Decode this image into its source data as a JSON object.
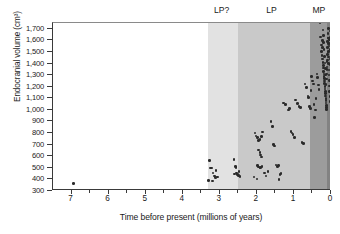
{
  "chart_data": {
    "type": "scatter",
    "title": "",
    "xlabel": "Time before present (millions of years)",
    "ylabel": "Endocranial volume (cm³)",
    "xlim": [
      7.5,
      0
    ],
    "ylim": [
      300,
      1750
    ],
    "x_reversed": true,
    "grid": false,
    "legend_position": "none",
    "xticks": [
      7,
      6,
      5,
      4,
      3,
      2,
      1,
      0
    ],
    "xtick_labels": [
      "7",
      "6",
      "5",
      "4",
      "3",
      "2",
      "1",
      "0"
    ],
    "xminor_ticks": [
      6.5,
      5.5,
      4.5,
      3.5,
      2.5,
      1.5,
      0.5
    ],
    "yticks": [
      300,
      400,
      500,
      600,
      700,
      800,
      900,
      1000,
      1100,
      1200,
      1300,
      1400,
      1500,
      1600,
      1700
    ],
    "ytick_labels": [
      "300",
      "400",
      "500",
      "600",
      "700",
      "800",
      "900",
      "1,000",
      "1,100",
      "1,200",
      "1,300",
      "1,400",
      "1,500",
      "1,600",
      "1,700"
    ],
    "bands": [
      {
        "label": "LP?",
        "x_start": 3.32,
        "x_end": 2.52,
        "color": "#e2e2e2",
        "label_x": 2.92
      },
      {
        "label": "LP",
        "x_start": 2.52,
        "x_end": 0.56,
        "color": "#c9c9c9",
        "label_x": 1.58
      },
      {
        "label": "MP",
        "x_start": 0.56,
        "x_end": 0.12,
        "color": "#9c9c9c",
        "label_x": 0.3
      },
      {
        "label": "",
        "x_start": 0.12,
        "x_end": 0.0,
        "color": "#828282",
        "label_x": 0.05
      }
    ],
    "point_color": "#2a2a2a",
    "points": [
      [
        6.95,
        365
      ],
      [
        4.4,
        308
      ],
      [
        3.28,
        565
      ],
      [
        3.25,
        500
      ],
      [
        3.22,
        498
      ],
      [
        3.18,
        455
      ],
      [
        3.15,
        430
      ],
      [
        3.12,
        415
      ],
      [
        3.1,
        478
      ],
      [
        3.06,
        420
      ],
      [
        3.3,
        392
      ],
      [
        3.2,
        388
      ],
      [
        2.62,
        570
      ],
      [
        2.58,
        512
      ],
      [
        2.55,
        455
      ],
      [
        2.52,
        440
      ],
      [
        2.5,
        432
      ],
      [
        2.48,
        470
      ],
      [
        2.45,
        425
      ],
      [
        2.56,
        505
      ],
      [
        2.6,
        448
      ],
      [
        2.05,
        800
      ],
      [
        2.02,
        775
      ],
      [
        1.98,
        760
      ],
      [
        1.95,
        735
      ],
      [
        1.92,
        742
      ],
      [
        1.88,
        770
      ],
      [
        1.85,
        810
      ],
      [
        1.95,
        655
      ],
      [
        1.92,
        630
      ],
      [
        1.9,
        610
      ],
      [
        1.88,
        592
      ],
      [
        1.98,
        520
      ],
      [
        1.95,
        508
      ],
      [
        1.92,
        497
      ],
      [
        1.9,
        502
      ],
      [
        1.86,
        512
      ],
      [
        2.08,
        420
      ],
      [
        2.0,
        405
      ],
      [
        1.8,
        455
      ],
      [
        1.75,
        430
      ],
      [
        1.7,
        470
      ],
      [
        1.62,
        900
      ],
      [
        1.58,
        855
      ],
      [
        1.55,
        700
      ],
      [
        1.52,
        690
      ],
      [
        1.48,
        525
      ],
      [
        1.45,
        512
      ],
      [
        1.42,
        520
      ],
      [
        1.4,
        398
      ],
      [
        1.38,
        440
      ],
      [
        1.35,
        450
      ],
      [
        1.28,
        1060
      ],
      [
        1.22,
        1045
      ],
      [
        1.15,
        1000
      ],
      [
        1.12,
        1010
      ],
      [
        1.08,
        815
      ],
      [
        1.05,
        800
      ],
      [
        1.02,
        790
      ],
      [
        0.98,
        760
      ],
      [
        0.95,
        1085
      ],
      [
        0.9,
        1055
      ],
      [
        0.86,
        1030
      ],
      [
        0.82,
        1020
      ],
      [
        0.78,
        720
      ],
      [
        0.74,
        712
      ],
      [
        0.7,
        1225
      ],
      [
        0.66,
        1195
      ],
      [
        0.62,
        1120
      ],
      [
        0.6,
        1105
      ],
      [
        0.58,
        1030
      ],
      [
        0.56,
        1010
      ],
      [
        0.54,
        1165
      ],
      [
        0.52,
        1290
      ],
      [
        0.5,
        1250
      ],
      [
        0.48,
        1225
      ],
      [
        0.46,
        1045
      ],
      [
        0.44,
        935
      ],
      [
        0.42,
        1000
      ],
      [
        0.4,
        1100
      ],
      [
        0.38,
        1310
      ],
      [
        0.36,
        1280
      ],
      [
        0.34,
        1215
      ],
      [
        0.32,
        1175
      ],
      [
        0.3,
        1750
      ],
      [
        0.28,
        1630
      ],
      [
        0.26,
        1560
      ],
      [
        0.25,
        1505
      ],
      [
        0.24,
        1470
      ],
      [
        0.23,
        1440
      ],
      [
        0.22,
        1410
      ],
      [
        0.21,
        1385
      ],
      [
        0.2,
        1360
      ],
      [
        0.195,
        1330
      ],
      [
        0.19,
        1310
      ],
      [
        0.185,
        1290
      ],
      [
        0.18,
        1270
      ],
      [
        0.175,
        1250
      ],
      [
        0.17,
        1230
      ],
      [
        0.165,
        1200
      ],
      [
        0.16,
        1180
      ],
      [
        0.155,
        1160
      ],
      [
        0.15,
        1140
      ],
      [
        0.145,
        1120
      ],
      [
        0.14,
        1100
      ],
      [
        0.135,
        1080
      ],
      [
        0.13,
        1060
      ],
      [
        0.125,
        1040
      ],
      [
        0.12,
        1020
      ],
      [
        0.115,
        1005
      ],
      [
        0.11,
        1350
      ],
      [
        0.105,
        1420
      ],
      [
        0.1,
        1480
      ],
      [
        0.095,
        1540
      ],
      [
        0.09,
        1590
      ],
      [
        0.085,
        1620
      ],
      [
        0.08,
        1660
      ],
      [
        0.075,
        1700
      ],
      [
        0.07,
        1505
      ],
      [
        0.065,
        1455
      ],
      [
        0.06,
        1400
      ],
      [
        0.055,
        1345
      ],
      [
        0.05,
        1300
      ],
      [
        0.045,
        1255
      ],
      [
        0.04,
        1205
      ],
      [
        0.035,
        1160
      ],
      [
        0.03,
        1115
      ],
      [
        0.025,
        1070
      ],
      [
        0.02,
        1390
      ],
      [
        0.015,
        1440
      ],
      [
        0.012,
        1520
      ],
      [
        0.01,
        1575
      ],
      [
        0.008,
        1625
      ],
      [
        0.006,
        1680
      ],
      [
        0.005,
        1720
      ],
      [
        0.045,
        1610
      ],
      [
        0.055,
        1550
      ],
      [
        0.065,
        1620
      ],
      [
        0.075,
        1575
      ],
      [
        0.085,
        1500
      ],
      [
        0.095,
        1430
      ],
      [
        0.105,
        1370
      ],
      [
        0.115,
        1310
      ],
      [
        0.125,
        1265
      ],
      [
        0.135,
        1220
      ],
      [
        0.145,
        1300
      ],
      [
        0.155,
        1355
      ],
      [
        0.165,
        1405
      ],
      [
        0.175,
        1460
      ],
      [
        0.185,
        1520
      ],
      [
        0.195,
        1580
      ],
      [
        0.205,
        1640
      ],
      [
        0.215,
        1690
      ],
      [
        0.225,
        1600
      ],
      [
        0.235,
        1540
      ]
    ]
  }
}
